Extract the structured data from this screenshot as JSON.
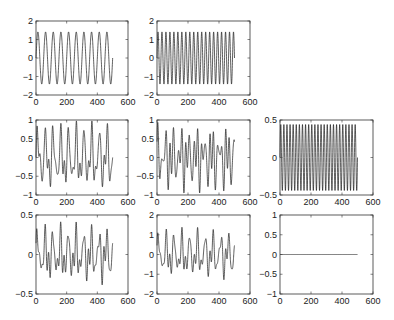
{
  "figure": {
    "width": 394,
    "height": 320,
    "line_color": "#1a1a1a",
    "frame_color": "#333333"
  },
  "chart_data": [
    {
      "type": "line",
      "id": "r1c1",
      "row": 1,
      "col": 1,
      "frame": {
        "x": 36,
        "y": 21,
        "w": 92,
        "h": 74
      },
      "xlim": [
        0,
        600
      ],
      "ylim": [
        -2,
        2
      ],
      "xticks": [
        0,
        200,
        400,
        600
      ],
      "yticks": [
        -2,
        -1,
        0,
        1,
        2
      ],
      "xtick_labels": [
        "0",
        "200",
        "400",
        "600"
      ],
      "ytick_labels": [
        "-2",
        "-1",
        "0",
        "1",
        "2"
      ],
      "signal": {
        "n": 500,
        "components": [
          {
            "amp": 1.41,
            "cycles": 10,
            "phase": 0
          }
        ],
        "end_value": -0.6
      },
      "title": "",
      "xlabel": "",
      "ylabel": "",
      "grid": false
    },
    {
      "type": "line",
      "id": "r1c2",
      "row": 1,
      "col": 2,
      "frame": {
        "x": 157,
        "y": 21,
        "w": 93,
        "h": 74
      },
      "xlim": [
        0,
        600
      ],
      "ylim": [
        -2,
        2
      ],
      "xticks": [
        0,
        200,
        400,
        600
      ],
      "yticks": [
        -2,
        -1,
        0,
        1,
        2
      ],
      "xtick_labels": [
        "0",
        "200",
        "400",
        "600"
      ],
      "ytick_labels": [
        "-2",
        "-1",
        "0",
        "1",
        "2"
      ],
      "signal": {
        "n": 500,
        "components": [
          {
            "amp": 1.41,
            "cycles": 19.5,
            "phase": 0
          }
        ]
      },
      "title": "",
      "xlabel": "",
      "ylabel": "",
      "grid": false
    },
    {
      "type": "line",
      "id": "r2c1",
      "row": 2,
      "col": 1,
      "frame": {
        "x": 36,
        "y": 120,
        "w": 92,
        "h": 75
      },
      "xlim": [
        0,
        600
      ],
      "ylim": [
        -1,
        1
      ],
      "xticks": [
        0,
        200,
        400,
        600
      ],
      "yticks": [
        -1,
        -0.5,
        0,
        0.5,
        1
      ],
      "xtick_labels": [
        "0",
        "200",
        "400",
        "600"
      ],
      "ytick_labels": [
        "-1",
        "-0.5",
        "0",
        "0.5",
        "1"
      ],
      "signal": {
        "n": 500,
        "components": [
          {
            "amp": 0.55,
            "cycles": 10,
            "phase": 0
          },
          {
            "amp": 0.3,
            "cycles": 19.5,
            "phase": 0
          },
          {
            "amp": 0.15,
            "cycles": 25,
            "phase": 0
          }
        ]
      },
      "title": "",
      "xlabel": "",
      "ylabel": "",
      "grid": false
    },
    {
      "type": "line",
      "id": "r2c2",
      "row": 2,
      "col": 2,
      "frame": {
        "x": 157,
        "y": 120,
        "w": 93,
        "h": 75
      },
      "xlim": [
        0,
        600
      ],
      "ylim": [
        -1,
        1
      ],
      "xticks": [
        0,
        200,
        400,
        600
      ],
      "yticks": [
        -1,
        -0.5,
        0,
        0.5,
        1
      ],
      "xtick_labels": [
        "0",
        "200",
        "400",
        "600"
      ],
      "ytick_labels": [
        "-1",
        "-0.5",
        "0",
        "0.5",
        "1"
      ],
      "signal": {
        "n": 500,
        "components": [
          {
            "amp": 0.35,
            "cycles": 10,
            "phase": 1.2
          },
          {
            "amp": 0.45,
            "cycles": 19.5,
            "phase": 0
          },
          {
            "amp": 0.2,
            "cycles": 25,
            "phase": 0.5
          }
        ]
      },
      "title": "",
      "xlabel": "",
      "ylabel": "",
      "grid": false
    },
    {
      "type": "line",
      "id": "r2c3",
      "row": 2,
      "col": 3,
      "frame": {
        "x": 280,
        "y": 120,
        "w": 93,
        "h": 75
      },
      "xlim": [
        0,
        600
      ],
      "ylim": [
        -0.5,
        0.5
      ],
      "xticks": [
        0,
        200,
        400,
        600
      ],
      "yticks": [
        -0.5,
        0,
        0.5
      ],
      "xtick_labels": [
        "0",
        "200",
        "400",
        "600"
      ],
      "ytick_labels": [
        "-0.5",
        "0",
        "0.5"
      ],
      "signal": {
        "n": 500,
        "components": [
          {
            "amp": 0.44,
            "cycles": 25,
            "phase": 0
          }
        ]
      },
      "title": "",
      "xlabel": "",
      "ylabel": "",
      "grid": false
    },
    {
      "type": "line",
      "id": "r3c1",
      "row": 3,
      "col": 1,
      "frame": {
        "x": 36,
        "y": 215,
        "w": 92,
        "h": 79
      },
      "xlim": [
        0,
        600
      ],
      "ylim": [
        -0.5,
        0.5
      ],
      "xticks": [
        0,
        200,
        400,
        600
      ],
      "yticks": [
        -0.5,
        0,
        0.5
      ],
      "xtick_labels": [
        "0",
        "200",
        "400",
        "600"
      ],
      "ytick_labels": [
        "-0.5",
        "0",
        "0.5"
      ],
      "signal": {
        "n": 500,
        "components": [
          {
            "amp": 0.2,
            "cycles": 10,
            "phase": 0.3
          },
          {
            "amp": 0.12,
            "cycles": 19.5,
            "phase": 0
          },
          {
            "amp": 0.1,
            "cycles": 25,
            "phase": 1.0
          }
        ]
      },
      "title": "",
      "xlabel": "",
      "ylabel": "",
      "grid": false
    },
    {
      "type": "line",
      "id": "r3c2",
      "row": 3,
      "col": 2,
      "frame": {
        "x": 157,
        "y": 215,
        "w": 93,
        "h": 79
      },
      "xlim": [
        0,
        600
      ],
      "ylim": [
        -2,
        2
      ],
      "xticks": [
        0,
        200,
        400,
        600
      ],
      "yticks": [
        -2,
        -1,
        0,
        1,
        2
      ],
      "xtick_labels": [
        "0",
        "200",
        "400",
        "600"
      ],
      "ytick_labels": [
        "-2",
        "-1",
        "0",
        "1",
        "2"
      ],
      "signal": {
        "n": 500,
        "components": [
          {
            "amp": 0.7,
            "cycles": 10,
            "phase": 0.3
          },
          {
            "amp": 0.4,
            "cycles": 19.5,
            "phase": 0
          },
          {
            "amp": 0.3,
            "cycles": 25,
            "phase": 1.0
          }
        ]
      },
      "title": "",
      "xlabel": "",
      "ylabel": "",
      "grid": false
    },
    {
      "type": "line",
      "id": "r3c3",
      "row": 3,
      "col": 3,
      "frame": {
        "x": 280,
        "y": 215,
        "w": 93,
        "h": 79
      },
      "xlim": [
        0,
        600
      ],
      "ylim": [
        -1,
        1
      ],
      "xticks": [
        0,
        200,
        400,
        600
      ],
      "yticks": [
        -1,
        -0.5,
        0,
        0.5,
        1
      ],
      "xtick_labels": [
        "0",
        "200",
        "400",
        "600"
      ],
      "ytick_labels": [
        "-1",
        "-0.5",
        "0",
        "0.5",
        "1"
      ],
      "signal": {
        "n": 500,
        "components": [],
        "constant": 0
      },
      "title": "",
      "xlabel": "",
      "ylabel": "",
      "grid": false
    }
  ]
}
